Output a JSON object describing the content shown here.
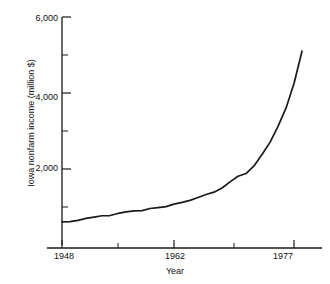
{
  "chart_data": {
    "type": "line",
    "title": "",
    "subtitle": "",
    "xlabel": "Year",
    "ylabel": "Iowa nonfarm income (million $)",
    "xlim": [
      1948,
      1979
    ],
    "ylim": [
      0,
      6000
    ],
    "grid": false,
    "legend": null,
    "x_ticks_major": [
      1948,
      1962,
      1977
    ],
    "x_tick_labels": [
      "1948",
      "1962",
      "1977"
    ],
    "x_ticks_minor": [
      1955,
      1969.5
    ],
    "y_ticks_major": [
      2000,
      4000,
      6000
    ],
    "y_tick_labels": [
      "2,000",
      "4,000",
      "6,000"
    ],
    "y_ticks_minor": [
      1000,
      3000,
      5000
    ],
    "series": [
      {
        "name": "Iowa nonfarm income",
        "color": "#1a1a1a",
        "x": [
          1948,
          1949,
          1950,
          1951,
          1952,
          1953,
          1954,
          1955,
          1956,
          1957,
          1958,
          1959,
          1960,
          1961,
          1962,
          1963,
          1964,
          1965,
          1966,
          1967,
          1968,
          1969,
          1970,
          1971,
          1972,
          1973,
          1974,
          1975,
          1976,
          1977,
          1978
        ],
        "values": [
          610,
          615,
          650,
          700,
          735,
          770,
          775,
          830,
          870,
          900,
          905,
          960,
          985,
          1010,
          1075,
          1120,
          1175,
          1250,
          1330,
          1390,
          1500,
          1660,
          1810,
          1880,
          2080,
          2380,
          2700,
          3120,
          3600,
          4250,
          5100
        ]
      }
    ],
    "annotations": []
  }
}
